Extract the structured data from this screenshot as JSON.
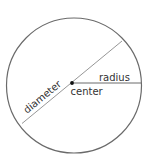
{
  "diagram": {
    "labels": {
      "radius": "radius",
      "center": "center",
      "diameter": "diameter"
    },
    "colors": {
      "stroke": "#6a6a6a",
      "text": "#333333",
      "dot": "#111111",
      "background": "#ffffff"
    }
  }
}
